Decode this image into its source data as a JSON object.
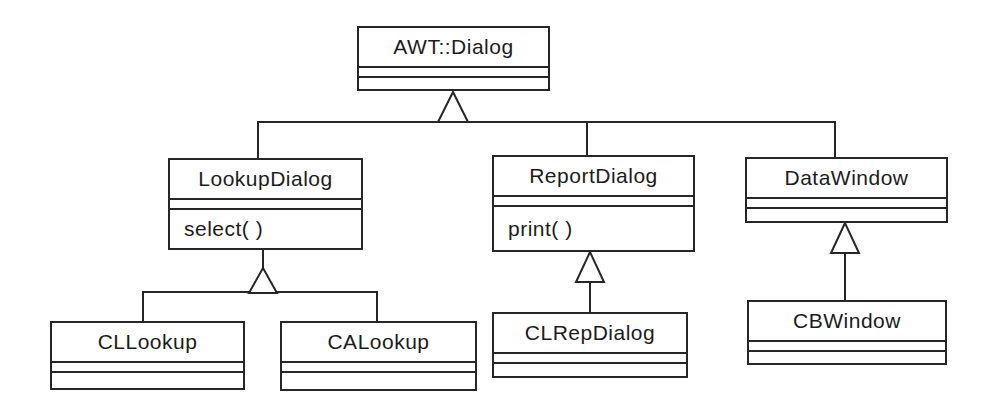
{
  "diagram_type": "uml-class-inheritance-diagram",
  "classes": {
    "awt_dialog": {
      "name": "AWT::Dialog",
      "operations": ""
    },
    "lookup_dialog": {
      "name": "LookupDialog",
      "operations": "select( )"
    },
    "report_dialog": {
      "name": "ReportDialog",
      "operations": "print( )"
    },
    "data_window": {
      "name": "DataWindow",
      "operations": ""
    },
    "cl_lookup": {
      "name": "CLLookup",
      "operations": ""
    },
    "ca_lookup": {
      "name": "CALookup",
      "operations": ""
    },
    "cl_rep_dialog": {
      "name": "CLRepDialog",
      "operations": ""
    },
    "cb_window": {
      "name": "CBWindow",
      "operations": ""
    }
  },
  "relationships": [
    {
      "type": "generalization",
      "parent": "AWT::Dialog",
      "children": [
        "LookupDialog",
        "ReportDialog",
        "DataWindow"
      ]
    },
    {
      "type": "generalization",
      "parent": "LookupDialog",
      "children": [
        "CLLookup",
        "CALookup"
      ]
    },
    {
      "type": "generalization",
      "parent": "ReportDialog",
      "children": [
        "CLRepDialog"
      ]
    },
    {
      "type": "generalization",
      "parent": "DataWindow",
      "children": [
        "CBWindow"
      ]
    }
  ],
  "colors": {
    "line": "#262626",
    "text": "#1c1c1c",
    "background": "#ffffff"
  }
}
